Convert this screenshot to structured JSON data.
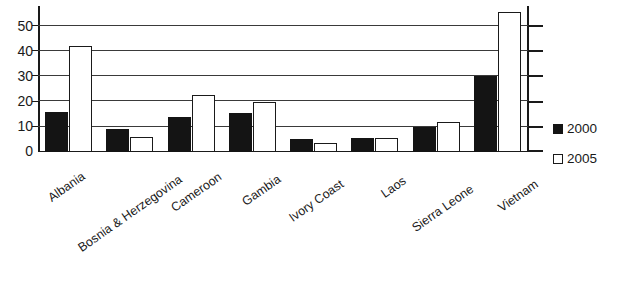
{
  "chart_data": {
    "type": "bar",
    "title": "",
    "subtitle": "",
    "xlabel": "",
    "ylabel": "",
    "ylim": [
      0,
      58
    ],
    "yticks": [
      0,
      10,
      20,
      30,
      40,
      50
    ],
    "grid": true,
    "legend_position": "right",
    "categories": [
      "Albania",
      "Bosnia & Herzegovina",
      "Cameroon",
      "Gambia",
      "Ivory Coast",
      "Laos",
      "Sierra Leone",
      "Vietnam"
    ],
    "series": [
      {
        "name": "2000",
        "color": "#141414",
        "values": [
          16,
          9,
          14,
          15.5,
          5,
          5.5,
          10,
          30
        ]
      },
      {
        "name": "2005",
        "color": "#ffffff",
        "values": [
          42,
          6,
          22.5,
          20,
          3.5,
          5.5,
          12,
          55.5
        ]
      }
    ]
  },
  "legend": {
    "items": [
      {
        "label": "2000",
        "swatch": "filled-square-black"
      },
      {
        "label": "2005",
        "swatch": "outlined-square-white"
      }
    ]
  },
  "axis": {
    "y_tick_labels": [
      "50",
      "40",
      "30",
      "20",
      "10",
      "0"
    ]
  }
}
